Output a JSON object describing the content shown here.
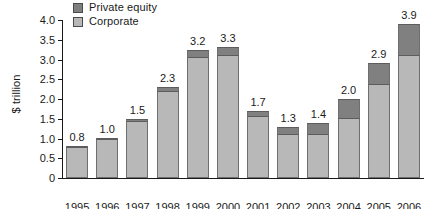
{
  "chart_data": {
    "type": "bar",
    "stacked": true,
    "title": "",
    "xlabel": "",
    "ylabel": "$ trillion",
    "ylim": [
      0,
      4.0
    ],
    "yticks": [
      "0",
      "0.5",
      "1.0",
      "1.5",
      "2.0",
      "2.5",
      "3.0",
      "3.5",
      "4.0"
    ],
    "grid": false,
    "legend_position": "top-left",
    "categories": [
      "1995",
      "1996",
      "1997",
      "1998",
      "1999",
      "2000",
      "2001",
      "2002",
      "2003",
      "2004",
      "2005",
      "2006"
    ],
    "series": [
      {
        "name": "Corporate",
        "color": "#b8b8b8",
        "values": [
          0.75,
          0.95,
          1.43,
          2.18,
          3.03,
          3.1,
          1.55,
          1.1,
          1.1,
          1.5,
          2.35,
          3.1
        ]
      },
      {
        "name": "Private equity",
        "color": "#808080",
        "values": [
          0.07,
          0.07,
          0.07,
          0.12,
          0.2,
          0.22,
          0.15,
          0.2,
          0.3,
          0.5,
          0.55,
          0.8
        ]
      }
    ],
    "totals": [
      "0.8",
      "1.0",
      "1.5",
      "2.3",
      "3.2",
      "3.3",
      "1.7",
      "1.3",
      "1.4",
      "2.0",
      "2.9",
      "3.9"
    ]
  }
}
